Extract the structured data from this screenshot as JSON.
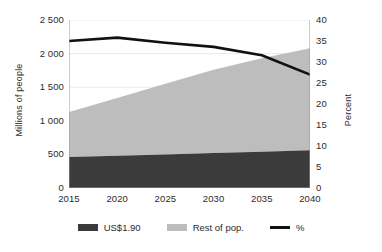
{
  "chart_data": {
    "type": "area",
    "title": "",
    "subtitle": "",
    "xlabel": "",
    "ylabel": "Millions of people",
    "y2label": "Percent",
    "x": [
      2015,
      2020,
      2025,
      2030,
      2035,
      2040
    ],
    "xtick_labels": [
      "2015",
      "2020",
      "2025",
      "2030",
      "2035",
      "2040"
    ],
    "xlim": [
      2015,
      2040
    ],
    "ylim": [
      0,
      2500
    ],
    "ytick_labels": [
      "0",
      "500",
      "1 000",
      "1 500",
      "2 000",
      "2 500"
    ],
    "yticks": [
      0,
      500,
      1000,
      1500,
      2000,
      2500
    ],
    "y2lim": [
      0,
      40
    ],
    "y2tick_labels": [
      "0",
      "5",
      "10",
      "15",
      "20",
      "25",
      "30",
      "35",
      "40"
    ],
    "y2ticks": [
      0,
      5,
      10,
      15,
      20,
      25,
      30,
      35,
      40
    ],
    "grid": true,
    "legend_position": "bottom",
    "stacked": true,
    "series": [
      {
        "name": "US$1.90",
        "type": "area",
        "axis": "left",
        "color": "#3b3b3b",
        "values": [
          460,
          480,
          500,
          520,
          540,
          560
        ]
      },
      {
        "name": "Rest of pop.",
        "type": "area",
        "axis": "left",
        "color": "#bdbdbd",
        "values": [
          670,
          860,
          1050,
          1240,
          1390,
          1520
        ]
      },
      {
        "name": "%",
        "type": "line",
        "axis": "right",
        "color": "#111111",
        "values": [
          35.0,
          35.8,
          34.6,
          33.6,
          31.6,
          27.0
        ]
      }
    ],
    "stacked_totals": [
      1130,
      1340,
      1550,
      1760,
      1930,
      2080
    ]
  },
  "legend": {
    "items": [
      {
        "label": "US$1.90",
        "marker": "square-swatch",
        "color": "#3b3b3b"
      },
      {
        "label": "Rest of pop.",
        "marker": "square-swatch",
        "color": "#bdbdbd"
      },
      {
        "label": "%",
        "marker": "line-swatch",
        "color": "#111111"
      }
    ]
  }
}
